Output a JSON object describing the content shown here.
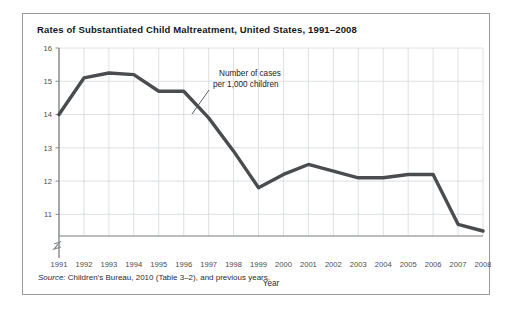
{
  "figure": {
    "title": "Rates of Substantiated Child Maltreatment, United States, 1991–2008",
    "source": {
      "label": "Source:",
      "text": " Children’s Bureau, 2010 (Table 3–2), and previous years."
    },
    "border_color": "#9a9a9a",
    "background": "#ffffff"
  },
  "chart_data": {
    "type": "line",
    "title": "Rates of Substantiated Child Maltreatment, United States, 1991–2008",
    "xlabel": "Year",
    "ylabel": "",
    "categories": [
      "1991",
      "1992",
      "1993",
      "1994",
      "1995",
      "1996",
      "1997",
      "1998",
      "1999",
      "2000",
      "2001",
      "2002",
      "2003",
      "2004",
      "2005",
      "2006",
      "2007",
      "2008"
    ],
    "values": [
      14.0,
      15.1,
      15.25,
      15.2,
      14.7,
      14.7,
      13.9,
      12.9,
      11.8,
      12.2,
      12.5,
      12.3,
      12.1,
      12.1,
      12.2,
      12.2,
      10.7,
      10.5
    ],
    "series": [
      {
        "name": "Number of cases per 1,000 children",
        "values": [
          14.0,
          15.1,
          15.25,
          15.2,
          14.7,
          14.7,
          13.9,
          12.9,
          11.8,
          12.2,
          12.5,
          12.3,
          12.1,
          12.1,
          12.2,
          12.2,
          10.7,
          10.5
        ]
      }
    ],
    "yticks": [
      11,
      12,
      13,
      14,
      15,
      16
    ],
    "ylim": [
      10.35,
      16.0
    ],
    "xlim": [
      1991,
      2008
    ],
    "grid": true,
    "axis_break": true,
    "legend": "none",
    "line_color": "#4a4c4f",
    "grid_color": "#d4d8dc",
    "axis_color": "#86898c",
    "annotations": [
      {
        "name": "series-callout",
        "line1": "Number of cases",
        "line2": "per 1,000 children"
      }
    ]
  },
  "axes": {
    "x_axis_title": "Year",
    "x_tick_labels": [
      "1991",
      "1992",
      "1993",
      "1994",
      "1995",
      "1996",
      "1997",
      "1998",
      "1999",
      "2000",
      "2001",
      "2002",
      "2003",
      "2004",
      "2005",
      "2006",
      "2007",
      "2008"
    ],
    "y_tick_labels": [
      "16",
      "15",
      "14",
      "13",
      "12",
      "11"
    ]
  }
}
